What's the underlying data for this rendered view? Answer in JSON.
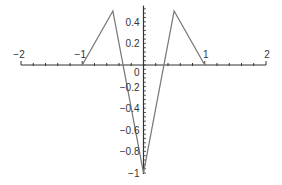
{
  "chart_data": {
    "type": "line",
    "title": "",
    "xlabel": "",
    "ylabel": "",
    "xlim": [
      -2,
      2
    ],
    "ylim": [
      -1,
      0.5
    ],
    "grid": false,
    "legend": null,
    "series": [
      {
        "name": "f(x)",
        "x": [
          -1,
          -0.5,
          0,
          0.5,
          1
        ],
        "y": [
          0,
          0.5,
          -1,
          0.5,
          0
        ],
        "color": "#7a7a7a"
      }
    ],
    "x_ticks": [
      {
        "value": -2,
        "label": "−2"
      },
      {
        "value": -1,
        "label": "−1"
      },
      {
        "value": 1,
        "label": "1"
      },
      {
        "value": 2,
        "label": "2"
      }
    ],
    "y_ticks": [
      {
        "value": 0.4,
        "label": "0.4"
      },
      {
        "value": 0.2,
        "label": "0.2"
      },
      {
        "value": 0,
        "label": "0"
      },
      {
        "value": -0.2,
        "label": "−0.2"
      },
      {
        "value": -0.4,
        "label": "−0.4"
      },
      {
        "value": -0.6,
        "label": "−0.6"
      },
      {
        "value": -0.8,
        "label": "−0.8"
      },
      {
        "value": -1,
        "label": "−1"
      }
    ],
    "axis_color": "#333333"
  }
}
